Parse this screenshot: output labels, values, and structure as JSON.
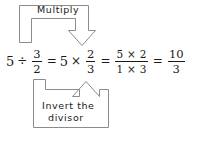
{
  "diagram": {
    "type": "annotated-equation",
    "stroke_color": "#8c8c8c",
    "text_color": "#1a1a1a",
    "background_color": "#ffffff"
  },
  "annotations": {
    "top": {
      "label": "Multiply",
      "icon": "u-arrow-down-icon",
      "points_to": "multiplication-sign",
      "direction": "down"
    },
    "bottom": {
      "label_line1": "Invert the",
      "label_line2": "divisor",
      "icon": "u-arrow-up-icon",
      "points_to": "reciprocal-fraction",
      "direction": "up"
    }
  },
  "equation": {
    "full_text": "5 ÷ 3/2 = 5 × 2/3 = (5 × 2)/(1 × 3) = 10/3",
    "terms": {
      "t1_whole": "5",
      "divide_sign": "÷",
      "t1_frac_num": "3",
      "t1_frac_den": "2",
      "equals1": "=",
      "t2_whole": "5",
      "times_sign": "×",
      "t2_frac_num": "2",
      "t2_frac_den": "3",
      "equals2": "=",
      "t3_frac_num": "5 × 2",
      "t3_frac_den": "1 × 3",
      "equals3": "=",
      "t4_frac_num": "10",
      "t4_frac_den": "3"
    }
  }
}
